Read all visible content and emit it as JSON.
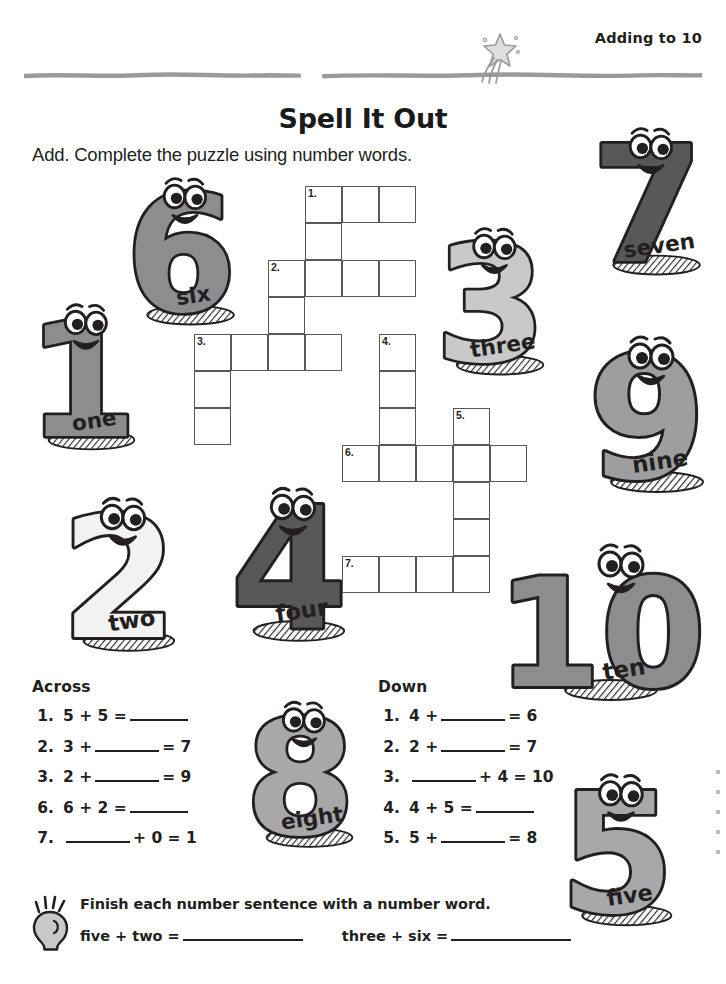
{
  "header": {
    "label": "Adding to 10",
    "star_icon": "shooting-star-icon"
  },
  "title": "Spell It Out",
  "instructions": "Add. Complete the puzzle using number words.",
  "crossword": {
    "cell_size": 37,
    "entries": [
      {
        "number": "1.",
        "direction": "across",
        "col": 3,
        "row": 0,
        "length": 3
      },
      {
        "number": "2.",
        "direction": "across",
        "col": 2,
        "row": 2,
        "length": 4
      },
      {
        "number": "3.",
        "direction": "across",
        "col": 0,
        "row": 4,
        "length": 4
      },
      {
        "number": "6.",
        "direction": "across",
        "col": 4,
        "row": 7,
        "length": 5
      },
      {
        "number": "7.",
        "direction": "across",
        "col": 4,
        "row": 10,
        "length": 3
      },
      {
        "number": "1.",
        "direction": "down",
        "col": 3,
        "row": 0,
        "length": 3
      },
      {
        "number": "2.",
        "direction": "down",
        "col": 2,
        "row": 2,
        "length": 3
      },
      {
        "number": "3.",
        "direction": "down",
        "col": 0,
        "row": 4,
        "length": 3
      },
      {
        "number": "4.",
        "direction": "down",
        "col": 5,
        "row": 4,
        "length": 4
      },
      {
        "number": "5.",
        "direction": "down",
        "col": 7,
        "row": 6,
        "length": 5
      }
    ]
  },
  "across": {
    "heading": "Across",
    "clues": [
      {
        "n": "1.",
        "pre": "5 + 5 =",
        "blank": "b-sm",
        "post": ""
      },
      {
        "n": "2.",
        "pre": "3 +",
        "blank": "b-md",
        "post": "= 7"
      },
      {
        "n": "3.",
        "pre": "2 +",
        "blank": "b-md",
        "post": "= 9"
      },
      {
        "n": "6.",
        "pre": "6 + 2 =",
        "blank": "b-sm",
        "post": ""
      },
      {
        "n": "7.",
        "pre": "",
        "blank": "b-md",
        "post": "+ 0 = 1"
      }
    ]
  },
  "down": {
    "heading": "Down",
    "clues": [
      {
        "n": "1.",
        "pre": "4 +",
        "blank": "b-md",
        "post": "= 6"
      },
      {
        "n": "2.",
        "pre": "2 +",
        "blank": "b-md",
        "post": "= 7"
      },
      {
        "n": "3.",
        "pre": "",
        "blank": "b-md",
        "post": "+ 4 = 10"
      },
      {
        "n": "4.",
        "pre": "4 + 5 =",
        "blank": "b-sm",
        "post": ""
      },
      {
        "n": "5.",
        "pre": "5 +",
        "blank": "b-md",
        "post": "= 8"
      }
    ]
  },
  "footer": {
    "bulb_icon": "lightbulb-icon",
    "line1": "Finish each number sentence with a number word.",
    "problem1_pre": "five + two =",
    "problem2_pre": "three + six ="
  },
  "characters": [
    {
      "digit": "6",
      "word": "six",
      "fill": "#8d8d8f",
      "x": 108,
      "y": 172,
      "w": 150,
      "h": 160
    },
    {
      "digit": "1",
      "word": "one",
      "fill": "#8d8d8f",
      "x": 28,
      "y": 290,
      "w": 112,
      "h": 175
    },
    {
      "digit": "3",
      "word": "three",
      "fill": "#c9c9cb",
      "x": 430,
      "y": 222,
      "w": 125,
      "h": 160
    },
    {
      "digit": "7",
      "word": "seven",
      "fill": "#58585b",
      "x": 588,
      "y": 122,
      "w": 122,
      "h": 160
    },
    {
      "digit": "9",
      "word": "nine",
      "fill": "#9e9ea0",
      "x": 588,
      "y": 330,
      "w": 122,
      "h": 170
    },
    {
      "digit": "2",
      "word": "two",
      "fill": "#f2f2f2",
      "x": 62,
      "y": 490,
      "w": 118,
      "h": 170
    },
    {
      "digit": "4",
      "word": "four",
      "fill": "#58585b",
      "x": 232,
      "y": 480,
      "w": 118,
      "h": 170
    },
    {
      "digit": "10",
      "word": "ten",
      "fill": "#8d8d8f",
      "x": 508,
      "y": 538,
      "w": 190,
      "h": 170
    },
    {
      "digit": "8",
      "word": "eight",
      "fill": "#a8a8aa",
      "x": 246,
      "y": 690,
      "w": 112,
      "h": 170
    },
    {
      "digit": "5",
      "word": "five",
      "fill": "#a8a8aa",
      "x": 558,
      "y": 768,
      "w": 122,
      "h": 165
    }
  ],
  "colors": {
    "ink": "#231f20",
    "grid_line": "#58585b",
    "rule": "#9a9a9c",
    "light_gray": "#c9c9cb"
  }
}
